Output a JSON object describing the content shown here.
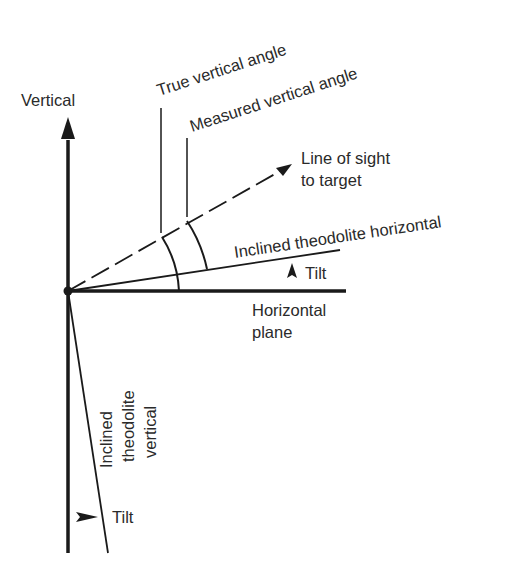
{
  "diagram": {
    "labels": {
      "vertical": "Vertical",
      "true_vertical_angle": "True vertical angle",
      "measured_vertical_angle": "Measured vertical angle",
      "line_of_sight_1": "Line of sight",
      "line_of_sight_2": "to target",
      "inclined_horizontal": "Inclined theodolite horizontal",
      "tilt_horizontal": "Tilt",
      "horizontal_plane_1": "Horizontal",
      "horizontal_plane_2": "plane",
      "inclined_vertical_1": "Inclined",
      "inclined_vertical_2": "theodolite",
      "inclined_vertical_3": "vertical",
      "tilt_vertical": "Tilt"
    },
    "colors": {
      "line": "#1a1a1a",
      "text": "#2a2a2a",
      "background": "#ffffff"
    }
  }
}
